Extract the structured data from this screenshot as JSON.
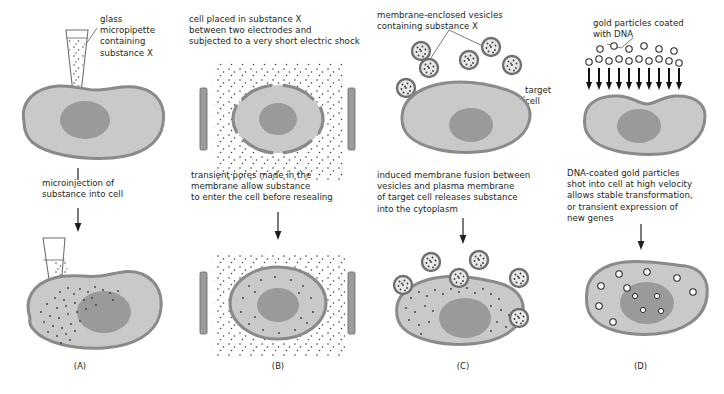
{
  "figure": {
    "background": "#ffffff",
    "colors": {
      "cytoplasm": "#c9c9c7",
      "membrane": "#8a8a88",
      "nucleus": "#9a9a98",
      "electrode": "#9b9b99",
      "particle_dot": "#3a3a3a",
      "text": "#231f20",
      "leader_line": "#5a5a5a"
    }
  },
  "panels": [
    {
      "id": "A",
      "label": "(A)",
      "method": "microinjection",
      "top_caption": "glass\nmicropipette\ncontaining\nsubstance X",
      "middle_caption": "microinjection of\nsubstance into cell",
      "top_scene": "micropipette filled with substance X held above an intact cell",
      "bottom_scene": "micropipette tip inserted through membrane, substance dispersing into cytoplasm"
    },
    {
      "id": "B",
      "label": "(B)",
      "method": "electroporation",
      "top_caption": "cell placed in substance X\nbetween two electrodes and\nsubjected to a very short electric shock",
      "middle_caption": "transient pores made in the\nmembrane allow substance\nto enter the cell before resealing",
      "top_scene": "cell between two electrodes, surrounded by substance X, membrane showing transient pores",
      "bottom_scene": "cell between two electrodes with substance X now inside and outside the cell"
    },
    {
      "id": "C",
      "label": "(C)",
      "method": "membrane fusion with vesicles",
      "top_caption": "membrane-enclosed vesicles\ncontaining substance X",
      "target_caption": "target\ncell",
      "middle_caption": "induced membrane fusion between\nvesicles and plasma membrane\nof target cell releases substance\ninto the cytoplasm",
      "top_scene": "substance-X-filled vesicles surrounding an intact target cell",
      "bottom_scene": "vesicles fusing with plasma membrane and releasing substance into cytoplasm"
    },
    {
      "id": "D",
      "label": "(D)",
      "method": "particle bombardment / gene gun",
      "top_caption": "gold particles coated\nwith DNA",
      "middle_caption": "DNA-coated gold particles\nshot into cell at high velocity\nallows stable transformation,\nor transient expression of\nnew genes",
      "top_scene": "array of DNA-coated gold particles driven downward by arrows toward a cell",
      "bottom_scene": "gold particles lodged in cytoplasm and nucleus of the cell"
    }
  ]
}
